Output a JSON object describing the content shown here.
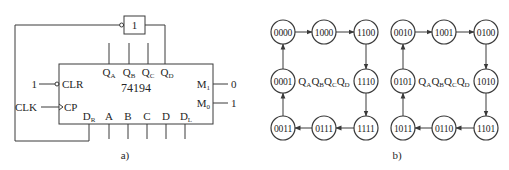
{
  "figure_a": {
    "caption": "a)",
    "chip_label": "74194",
    "gate_label": "1",
    "outputs": [
      {
        "main": "Q",
        "sub": "A"
      },
      {
        "main": "Q",
        "sub": "B"
      },
      {
        "main": "Q",
        "sub": "C"
      },
      {
        "main": "Q",
        "sub": "D"
      }
    ],
    "bottom_inputs": [
      {
        "main": "D",
        "sub": "R"
      },
      {
        "main": "A",
        "sub": ""
      },
      {
        "main": "B",
        "sub": ""
      },
      {
        "main": "C",
        "sub": ""
      },
      {
        "main": "D",
        "sub": ""
      },
      {
        "main": "D",
        "sub": "L"
      }
    ],
    "left_pins": {
      "clr_label": "CLR",
      "clr_value": "1",
      "cp_label": "CP",
      "clk_label": "CLK"
    },
    "right_pins": [
      {
        "main": "M",
        "sub": "1",
        "value": "0"
      },
      {
        "main": "M",
        "sub": "0",
        "value": "1"
      }
    ]
  },
  "figure_b": {
    "caption": "b)",
    "state_label": [
      {
        "main": "Q",
        "sub": "A"
      },
      {
        "main": "Q",
        "sub": "B"
      },
      {
        "main": "Q",
        "sub": "C"
      },
      {
        "main": "Q",
        "sub": "D"
      }
    ],
    "cycles": [
      {
        "states": [
          "0000",
          "1000",
          "1100",
          "1110",
          "1111",
          "0111",
          "0011",
          "0001"
        ]
      },
      {
        "states": [
          "0010",
          "1001",
          "0100",
          "1010",
          "1101",
          "0110",
          "1011",
          "0101"
        ]
      }
    ]
  }
}
